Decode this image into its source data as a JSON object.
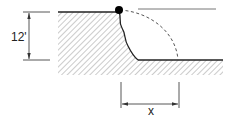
{
  "diagram": {
    "height_label": "12'",
    "offset_label": "x",
    "colors": {
      "line": "#222222",
      "hatch": "#9a9a9a",
      "dashed_arc": "#555555",
      "point": "#000000"
    }
  }
}
